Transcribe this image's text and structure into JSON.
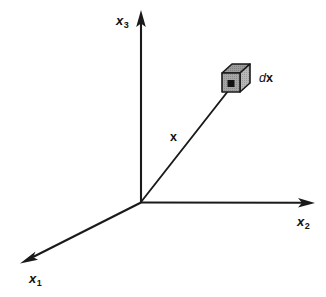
{
  "figure": {
    "type": "3d-coordinate-axes-diagram",
    "background_color": "#ffffff",
    "line_color": "#1a1a1a",
    "origin": {
      "x": 141,
      "y": 202
    }
  },
  "axes": {
    "x1": {
      "label_base": "x",
      "label_sub": "1",
      "tip": {
        "x": 22,
        "y": 262
      },
      "direction": "down-left"
    },
    "x2": {
      "label_base": "x",
      "label_sub": "2",
      "tip": {
        "x": 313,
        "y": 203
      },
      "direction": "right"
    },
    "x3": {
      "label_base": "x",
      "label_sub": "3",
      "tip": {
        "x": 141,
        "y": 12
      },
      "direction": "up"
    }
  },
  "vector": {
    "label": "x",
    "from": {
      "x": 141,
      "y": 202
    },
    "to": {
      "x": 232,
      "y": 86
    }
  },
  "volume_element": {
    "label_prefix": "d",
    "label_vector": "x",
    "shape": "cube",
    "face_color": "#9a9a9a",
    "top_color": "#8a8a8a",
    "side_color": "#b4b4b4",
    "point_color": "#111111",
    "bounds": {
      "x": 222,
      "y": 64,
      "width": 28,
      "height": 28
    }
  },
  "caption": {
    "text": "",
    "note": "cut off at bottom edge"
  },
  "colors": {
    "ink": "#1a1a1a",
    "cube_fill": "#9a9a9a",
    "cube_top": "#8a8a8a",
    "cube_side": "#b4b4b4",
    "background": "#ffffff"
  }
}
